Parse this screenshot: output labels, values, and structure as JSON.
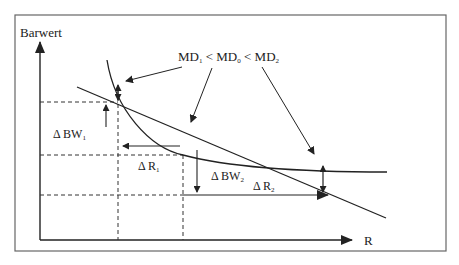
{
  "diagram": {
    "axes": {
      "y_label": "Barwert",
      "x_label": "R"
    },
    "labels": {
      "md_relation": {
        "md1": "MD",
        "sub1": "1",
        "lt1": " < ",
        "md0": "MD",
        "sub0": "0",
        "lt2": " < ",
        "md2": "MD",
        "sub2": "2"
      },
      "delta_bw1": {
        "delta": "Δ",
        "text": "BW",
        "sub": "1"
      },
      "delta_r1": {
        "delta": "Δ",
        "text": "R",
        "sub": "1"
      },
      "delta_bw2": {
        "delta": "Δ",
        "text": "BW",
        "sub": "2"
      },
      "delta_r2": {
        "delta": "Δ",
        "text": "R",
        "sub": "2"
      }
    },
    "colors": {
      "line": "#222222",
      "frame": "#555555",
      "background": "#ffffff"
    }
  }
}
